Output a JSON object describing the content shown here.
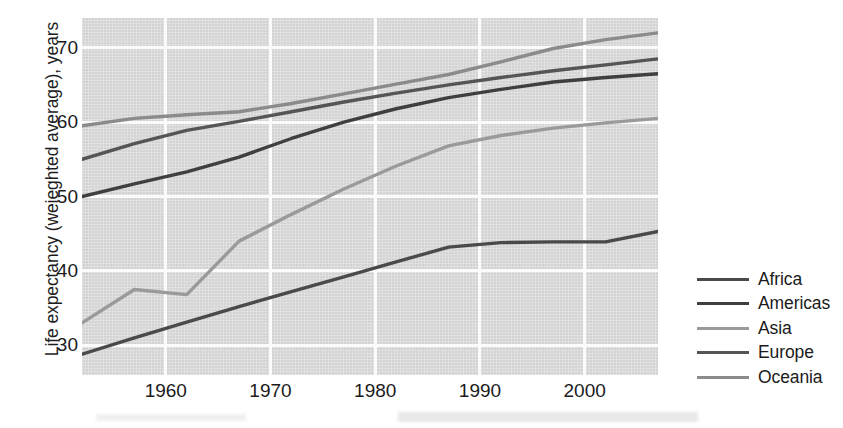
{
  "chart_data": {
    "type": "line",
    "title": "",
    "xlabel": "",
    "ylabel": "Life expectancy (weieghted average), years",
    "xlim": [
      1952,
      2007
    ],
    "ylim": [
      26,
      74
    ],
    "xticks": [
      1960,
      1970,
      1980,
      1990,
      2000
    ],
    "xtick_labels": [
      "1960",
      "1970",
      "1980",
      "1990",
      "2000"
    ],
    "yticks": [
      30,
      40,
      50,
      60,
      70
    ],
    "ytick_labels": [
      "30",
      "40",
      "50",
      "60",
      "70"
    ],
    "grid": true,
    "legend_position": "right",
    "plot_background": "#d3d3d3",
    "gridline_color": "#fbfbfb",
    "x": [
      1952,
      1957,
      1962,
      1967,
      1972,
      1977,
      1982,
      1987,
      1992,
      1997,
      2002,
      2007
    ],
    "series": [
      {
        "name": "Africa",
        "color": "#4a4a4a",
        "values": [
          28.8,
          31.0,
          33.1,
          35.2,
          37.2,
          39.2,
          41.2,
          43.2,
          43.8,
          43.9,
          43.9,
          45.3
        ]
      },
      {
        "name": "Americas",
        "color": "#3f3f3f",
        "values": [
          50.0,
          51.7,
          53.3,
          55.3,
          57.8,
          60.0,
          61.8,
          63.3,
          64.4,
          65.4,
          66.0,
          66.5
        ]
      },
      {
        "name": "Asia",
        "color": "#9a9a9a",
        "values": [
          33.0,
          37.5,
          36.8,
          44.0,
          47.6,
          51.0,
          54.1,
          56.8,
          58.2,
          59.2,
          59.9,
          60.5
        ]
      },
      {
        "name": "Europe",
        "color": "#555555",
        "values": [
          55.0,
          57.1,
          58.9,
          60.1,
          61.4,
          62.7,
          63.9,
          65.0,
          66.0,
          66.9,
          67.7,
          68.5
        ]
      },
      {
        "name": "Oceania",
        "color": "#8b8b8b",
        "values": [
          59.5,
          60.5,
          61.0,
          61.4,
          62.5,
          63.8,
          65.1,
          66.4,
          68.1,
          69.9,
          71.1,
          72.0
        ]
      }
    ]
  },
  "axis": {
    "y_title": "Life expectancy (weieghted average), years",
    "y_tick_labels": [
      "70",
      "60",
      "50",
      "40",
      "30"
    ],
    "x_tick_labels": [
      "1960",
      "1970",
      "1980",
      "1990",
      "2000"
    ]
  },
  "legend": {
    "items": [
      {
        "label": "Africa",
        "color": "#4a4a4a"
      },
      {
        "label": "Americas",
        "color": "#3f3f3f"
      },
      {
        "label": "Asia",
        "color": "#9a9a9a"
      },
      {
        "label": "Europe",
        "color": "#555555"
      },
      {
        "label": "Oceania",
        "color": "#8b8b8b"
      }
    ]
  }
}
